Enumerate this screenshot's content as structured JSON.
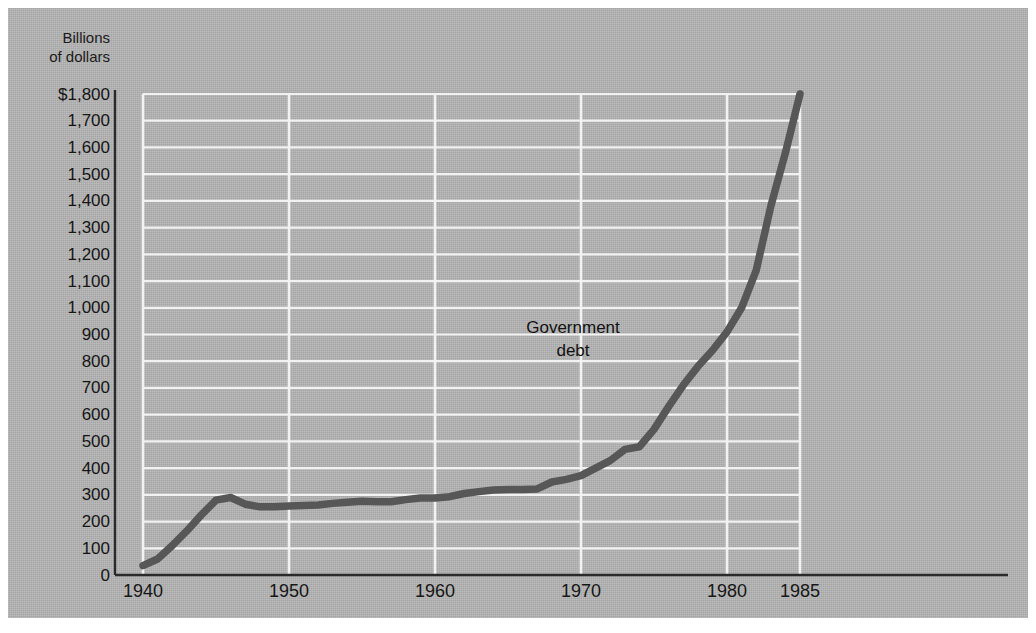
{
  "figure": {
    "panel_background": "#b4b4b4",
    "page_background": "#ffffff",
    "grid_color": "#f2f2f2",
    "axis_color": "#2a2a2a",
    "line_color": "#575757"
  },
  "axis_title": {
    "line1": "Billions",
    "line2": "of dollars"
  },
  "annotation": {
    "line1": "Government",
    "line2": "debt"
  },
  "chart_data": {
    "type": "line",
    "title": "",
    "subtitle": "",
    "xlabel": "",
    "ylabel": "Billions of dollars",
    "xlim": [
      1940,
      1985
    ],
    "ylim": [
      0,
      1800
    ],
    "grid": true,
    "legend_position": "inline-annotation",
    "y_tick_labels": [
      "$1,800",
      "1,700",
      "1,600",
      "1,500",
      "1,400",
      "1,300",
      "1,200",
      "1,100",
      "1,000",
      "900",
      "800",
      "700",
      "600",
      "500",
      "400",
      "300",
      "200",
      "100",
      "0"
    ],
    "y_tick_values": [
      1800,
      1700,
      1600,
      1500,
      1400,
      1300,
      1200,
      1100,
      1000,
      900,
      800,
      700,
      600,
      500,
      400,
      300,
      200,
      100,
      0
    ],
    "x_tick_labels": [
      "1940",
      "1950",
      "1960",
      "1970",
      "1980",
      "1985"
    ],
    "x_tick_values": [
      1940,
      1950,
      1960,
      1970,
      1980,
      1985
    ],
    "x_major_gridlines": [
      1940,
      1950,
      1960,
      1970,
      1980,
      1985
    ],
    "series": [
      {
        "name": "Government debt",
        "units": "billions of dollars",
        "x": [
          1940,
          1941,
          1942,
          1943,
          1944,
          1945,
          1946,
          1947,
          1948,
          1949,
          1950,
          1951,
          1952,
          1953,
          1954,
          1955,
          1956,
          1957,
          1958,
          1959,
          1960,
          1961,
          1962,
          1963,
          1964,
          1965,
          1966,
          1967,
          1968,
          1969,
          1970,
          1971,
          1972,
          1973,
          1974,
          1975,
          1976,
          1977,
          1978,
          1979,
          1980,
          1981,
          1982,
          1983,
          1984,
          1985
        ],
        "values": [
          35,
          60,
          110,
          165,
          225,
          280,
          290,
          265,
          255,
          255,
          258,
          260,
          262,
          268,
          272,
          276,
          274,
          274,
          282,
          288,
          288,
          293,
          305,
          312,
          318,
          320,
          320,
          322,
          348,
          358,
          372,
          400,
          428,
          470,
          480,
          545,
          630,
          710,
          780,
          840,
          910,
          1000,
          1140,
          1380,
          1580,
          1800
        ]
      }
    ]
  }
}
